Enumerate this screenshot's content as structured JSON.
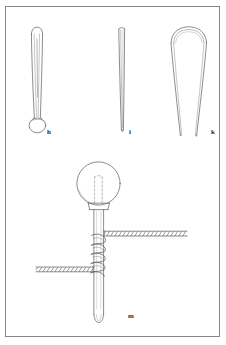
{
  "plate": {
    "title": "Archaeological artefact plate",
    "background_color": "#ffffff",
    "frame_color": "#8d8d8d",
    "ink_color": "#4a4a4a",
    "figure_count": 4
  },
  "figures": [
    {
      "id": "fig-h",
      "label": "h",
      "name": "bulb-headed-pin",
      "description": "Slender shafted pin with rounded top and a flattened oval disc at the lower end",
      "orientation": "vertical",
      "height_px": 112
    },
    {
      "id": "fig-i",
      "label": "i",
      "name": "plain-tapering-rod",
      "description": "Long plain rod tapering to a narrow point at the base",
      "orientation": "vertical",
      "height_px": 110
    },
    {
      "id": "fig-k",
      "label": "k",
      "name": "hairpin-loop",
      "description": "Double-armed hairpin with a wide rounded bend at the top and two splayed open ends below",
      "orientation": "vertical",
      "height_px": 112
    },
    {
      "id": "fig-m",
      "label": "m",
      "name": "globe-headed-cross-pin",
      "description": "Large pin with a spherical head, a collar below it, two twisted-wire cross bars bound to the shaft by a spiral coil, and a pointed tip",
      "orientation": "vertical",
      "height_px": 160,
      "details": [
        "spherical head with dashed internal tang lines",
        "collar at head junction",
        "upper twisted cross-bar extending to the right",
        "lower twisted cross-bar extending to the left",
        "spiral wire binding between the cross-bars",
        "tapered tip"
      ]
    }
  ],
  "labels": {
    "h": "h",
    "i": "i",
    "k": "k",
    "m": "m"
  }
}
